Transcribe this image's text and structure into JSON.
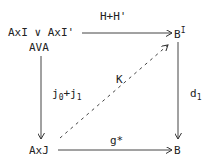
{
  "diagram": {
    "nodes": {
      "top_left_line1": "AxI ∨ AxI'",
      "top_left_line2": "AVA",
      "top_right_base": "B",
      "top_right_sup": "I",
      "bottom_left": "AxJ",
      "bottom_right": "B"
    },
    "arrows": {
      "top": {
        "label": "H+H'",
        "style": "solid"
      },
      "left": {
        "label_base": "j",
        "label_sub0": "0",
        "label_plus": "+j",
        "label_sub1": "1",
        "style": "solid"
      },
      "right": {
        "label_base": "d",
        "label_sub": "1",
        "style": "solid"
      },
      "bottom": {
        "label": "g*",
        "style": "solid"
      },
      "diagonal": {
        "label": "K",
        "style": "dashed"
      }
    }
  }
}
